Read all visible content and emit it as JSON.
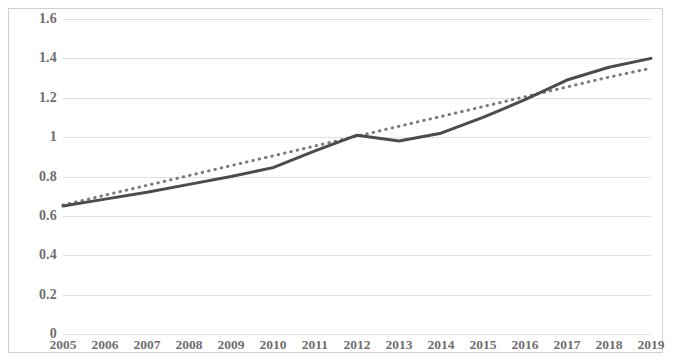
{
  "chart_data": {
    "type": "line",
    "title": "",
    "subtitle": "",
    "xlabel": "",
    "ylabel": "",
    "categories": [
      "2005",
      "2006",
      "2007",
      "2008",
      "2009",
      "2010",
      "2011",
      "2012",
      "2013",
      "2014",
      "2015",
      "2016",
      "2017",
      "2018",
      "2019"
    ],
    "series": [
      {
        "name": "data-series",
        "style": "solid",
        "color": "#4c4c4c",
        "values": [
          0.65,
          0.685,
          0.72,
          0.76,
          0.8,
          0.845,
          0.93,
          1.01,
          0.98,
          1.02,
          1.1,
          1.19,
          1.29,
          1.355,
          1.4
        ]
      },
      {
        "name": "trendline",
        "style": "dotted",
        "color": "#7b7b7b",
        "values": [
          0.655,
          0.705,
          0.755,
          0.805,
          0.855,
          0.905,
          0.955,
          1.005,
          1.055,
          1.105,
          1.155,
          1.205,
          1.255,
          1.305,
          1.35
        ]
      }
    ],
    "ylim": [
      0,
      1.6
    ],
    "yticks": [
      0,
      0.2,
      0.4,
      0.6,
      0.8,
      1,
      1.2,
      1.4,
      1.6
    ],
    "ytick_labels": [
      "0",
      "0.2",
      "0.4",
      "0.6",
      "0.8",
      "1",
      "1.2",
      "1.4",
      "1.6"
    ],
    "grid": true,
    "grid_axis": "y",
    "grid_color": "#d9e2ea",
    "legend": false,
    "legend_position": "none",
    "border_color": "#d0d3d6",
    "background": "#ffffff"
  }
}
